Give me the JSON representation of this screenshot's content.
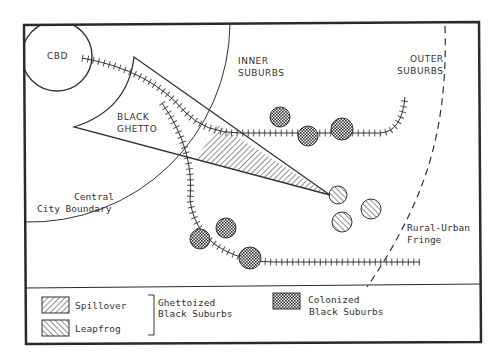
{
  "diagram": {
    "labels": {
      "cbd": "CBD",
      "inner_suburbs_1": "INNER",
      "inner_suburbs_2": "SUBURBS",
      "outer_suburbs_1": "OUTER",
      "outer_suburbs_2": "SUBURBS",
      "black_ghetto_1": "BLACK",
      "black_ghetto_2": "GHETTO",
      "central_city_1": "Central",
      "central_city_2": "City Boundary",
      "fringe_1": "Rural-Urban",
      "fringe_2": "Fringe"
    },
    "legend": {
      "spillover": "Spillover",
      "leapfrog": "Leapfrog",
      "ghettoized_1": "Ghettoized",
      "ghettoized_2": "Black Suburbs",
      "colonized_1": "Colonized",
      "colonized_2": "Black Suburbs"
    },
    "colors": {
      "ink": "#333333",
      "frame": "#2a2a2a",
      "background": "#ffffff"
    }
  }
}
